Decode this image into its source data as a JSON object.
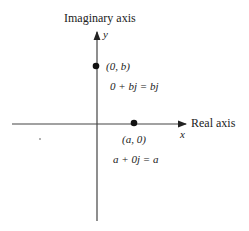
{
  "diagram": {
    "y_axis": {
      "label": "Imaginary axis",
      "var": "y"
    },
    "x_axis": {
      "label": "Real axis",
      "var": "x"
    },
    "points": [
      {
        "coord": "(0, b)",
        "equation": "0 + bj = bj"
      },
      {
        "coord": "(a, 0)",
        "equation": "a + 0j = a"
      }
    ],
    "colors": {
      "ink": "#222222",
      "background": "#ffffff"
    }
  }
}
